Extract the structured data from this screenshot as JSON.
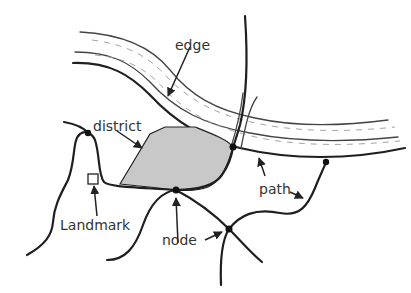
{
  "diagram": {
    "type": "Lynch city image elements",
    "colors": {
      "district_fill": "#c8c8c8",
      "stroke": "#1f1f1f",
      "label": "#333333",
      "background": "#ffffff"
    },
    "labels": {
      "edge": "edge",
      "district": "district",
      "path": "path",
      "landmark": "Landmark",
      "node": "node"
    }
  }
}
